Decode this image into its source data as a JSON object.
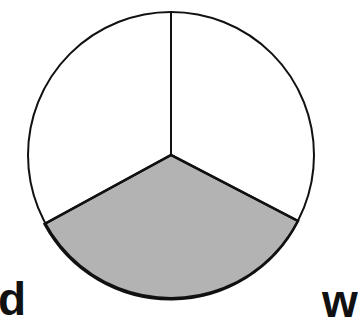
{
  "diagram": {
    "sectors": [
      {
        "name": "top-left",
        "shaded": false
      },
      {
        "name": "top-right",
        "shaded": false
      },
      {
        "name": "bottom",
        "shaded": true
      }
    ],
    "shaded_fraction": "1/3",
    "colors": {
      "shade": "#b3b3b3",
      "stroke": "#111111",
      "background": "#ffffff"
    }
  },
  "text_fragments": {
    "left": "d",
    "right": "w"
  }
}
